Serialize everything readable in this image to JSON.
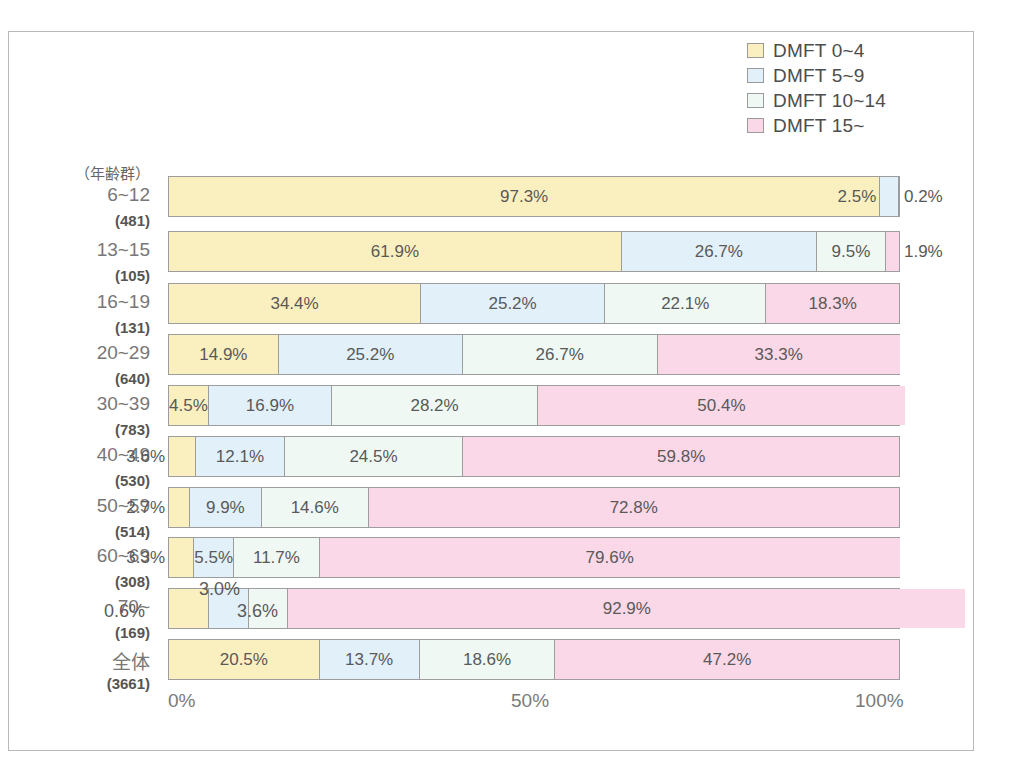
{
  "chart_data": {
    "type": "bar",
    "subtype": "100% stacked horizontal bar",
    "title": "",
    "xlabel": "",
    "ylabel": "（年齢群）",
    "xlim": [
      0,
      100
    ],
    "xticks": [
      "0%",
      "50%",
      "100%"
    ],
    "xtick_values": [
      0,
      50,
      100
    ],
    "grid": false,
    "legend_position": "top-right",
    "categories": [
      "6~12",
      "13~15",
      "16~19",
      "20~29",
      "30~39",
      "40~49",
      "50~59",
      "60~69",
      "70~",
      "全体"
    ],
    "category_counts": [
      "(481)",
      "(105)",
      "(131)",
      "(640)",
      "(783)",
      "(530)",
      "(514)",
      "(308)",
      "(169)",
      "(3661)"
    ],
    "series": [
      {
        "name": "DMFT 0~4",
        "color": "#faf0bf",
        "values": [
          97.3,
          61.9,
          34.4,
          14.9,
          4.5,
          3.6,
          2.7,
          3.3,
          0.6,
          20.5
        ]
      },
      {
        "name": "DMFT 5~9",
        "color": "#e2f0f9",
        "values": [
          2.5,
          26.7,
          25.2,
          25.2,
          16.9,
          12.1,
          9.9,
          5.5,
          3.0,
          13.7
        ]
      },
      {
        "name": "DMFT 10~14",
        "color": "#eff8f3",
        "values": [
          0.2,
          9.5,
          22.1,
          26.7,
          28.2,
          24.5,
          14.6,
          11.7,
          3.6,
          18.6
        ]
      },
      {
        "name": "DMFT 15~",
        "color": "#fbd8e7",
        "values": [
          0.0,
          1.9,
          18.3,
          33.3,
          50.4,
          59.8,
          72.8,
          79.6,
          92.9,
          47.2
        ]
      }
    ],
    "labels": [
      [
        "97.3%",
        "2.5%",
        "0.2%",
        ""
      ],
      [
        "61.9%",
        "26.7%",
        "9.5%",
        "1.9%"
      ],
      [
        "34.4%",
        "25.2%",
        "22.1%",
        "18.3%"
      ],
      [
        "14.9%",
        "25.2%",
        "26.7%",
        "33.3%"
      ],
      [
        "4.5%",
        "16.9%",
        "28.2%",
        "50.4%"
      ],
      [
        "3.6%",
        "12.1%",
        "24.5%",
        "59.8%"
      ],
      [
        "2.7%",
        "9.9%",
        "14.6%",
        "72.8%"
      ],
      [
        "3.3%",
        "5.5%",
        "11.7%",
        "79.6%"
      ],
      [
        "0.6%",
        "3.0%",
        "3.6%",
        "92.9%"
      ],
      [
        "20.5%",
        "13.7%",
        "18.6%",
        "47.2%"
      ]
    ]
  },
  "legend": {
    "items": [
      {
        "label": "DMFT 0~4",
        "color": "#faf0bf"
      },
      {
        "label": "DMFT 5~9",
        "color": "#e2f0f9"
      },
      {
        "label": "DMFT 10~14",
        "color": "#eff8f3"
      },
      {
        "label": "DMFT 15~",
        "color": "#fbd8e7"
      }
    ]
  },
  "axis": {
    "y_header": "（年齢群）",
    "x_ticks": [
      "0%",
      "50%",
      "100%"
    ]
  }
}
